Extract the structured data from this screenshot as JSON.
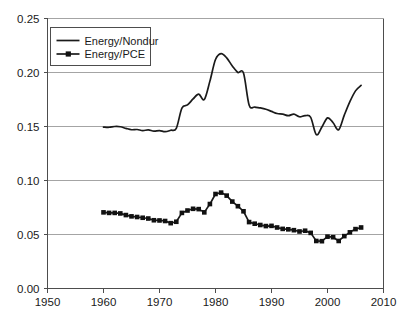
{
  "chart_data": {
    "type": "line",
    "title": "",
    "subtitle": "",
    "xlabel": "",
    "ylabel": "",
    "xlim": [
      1950,
      2010
    ],
    "ylim": [
      0.0,
      0.25
    ],
    "xticks": [
      "1950",
      "1960",
      "1970",
      "1980",
      "1990",
      "2000",
      "2010"
    ],
    "yticks": [
      "0.00",
      "0.05",
      "0.10",
      "0.15",
      "0.20",
      "0.25"
    ],
    "xtick_values": [
      1950,
      1960,
      1970,
      1980,
      1990,
      2000,
      2010
    ],
    "ytick_values": [
      0.0,
      0.05,
      0.1,
      0.15,
      0.2,
      0.25
    ],
    "grid": "horizontal",
    "legend_position": "top-left",
    "series": [
      {
        "name": "Energy/Nondur",
        "marker": "none",
        "color": "#1a1a1a",
        "x": [
          1960,
          1961,
          1962,
          1963,
          1964,
          1965,
          1966,
          1967,
          1968,
          1969,
          1970,
          1971,
          1972,
          1973,
          1974,
          1975,
          1976,
          1977,
          1978,
          1979,
          1980,
          1981,
          1982,
          1983,
          1984,
          1985,
          1986,
          1987,
          1988,
          1989,
          1990,
          1991,
          1992,
          1993,
          1994,
          1995,
          1996,
          1997,
          1998,
          1999,
          2000,
          2001,
          2002,
          2003,
          2004,
          2005,
          2006
        ],
        "values": [
          0.1495,
          0.1493,
          0.15,
          0.1498,
          0.1483,
          0.147,
          0.1472,
          0.1462,
          0.1468,
          0.1457,
          0.1462,
          0.1452,
          0.1465,
          0.1483,
          0.167,
          0.17,
          0.1755,
          0.18,
          0.175,
          0.192,
          0.212,
          0.2175,
          0.2135,
          0.206,
          0.2,
          0.1995,
          0.17,
          0.168,
          0.1672,
          0.166,
          0.164,
          0.162,
          0.1615,
          0.16,
          0.1615,
          0.159,
          0.16,
          0.1585,
          0.1425,
          0.1495,
          0.158,
          0.1535,
          0.147,
          0.1605,
          0.173,
          0.183,
          0.188
        ]
      },
      {
        "name": "Energy/PCE",
        "marker": "square",
        "color": "#111111",
        "x": [
          1960,
          1961,
          1962,
          1963,
          1964,
          1965,
          1966,
          1967,
          1968,
          1969,
          1970,
          1971,
          1972,
          1973,
          1974,
          1975,
          1976,
          1977,
          1978,
          1979,
          1980,
          1981,
          1982,
          1983,
          1984,
          1985,
          1986,
          1987,
          1988,
          1989,
          1990,
          1991,
          1992,
          1993,
          1994,
          1995,
          1996,
          1997,
          1998,
          1999,
          2000,
          2001,
          2002,
          2003,
          2004,
          2005,
          2006
        ],
        "values": [
          0.0705,
          0.07,
          0.07,
          0.0695,
          0.068,
          0.0668,
          0.0662,
          0.0655,
          0.0648,
          0.0632,
          0.063,
          0.0625,
          0.0605,
          0.0618,
          0.07,
          0.0722,
          0.0738,
          0.0735,
          0.0705,
          0.0782,
          0.0875,
          0.0888,
          0.086,
          0.0805,
          0.0762,
          0.0715,
          0.0615,
          0.06,
          0.0588,
          0.0578,
          0.058,
          0.0565,
          0.0552,
          0.0548,
          0.054,
          0.0528,
          0.0535,
          0.0515,
          0.044,
          0.0438,
          0.048,
          0.0475,
          0.044,
          0.0485,
          0.052,
          0.055,
          0.0565
        ]
      }
    ]
  },
  "legend": {
    "entries": [
      {
        "label": "Energy/Nondur"
      },
      {
        "label": "Energy/PCE"
      }
    ]
  },
  "colors": {
    "series_ink": "#1a1a1a",
    "gridline": "#9a9a9a",
    "frame": "#4d4d4d",
    "background": "#ffffff"
  }
}
